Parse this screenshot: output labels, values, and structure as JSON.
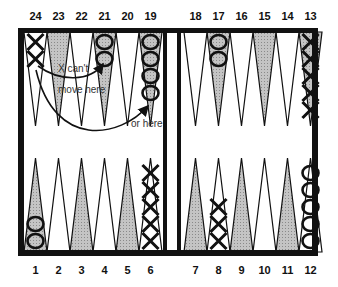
{
  "board": {
    "top_labels": [
      "24",
      "23",
      "22",
      "21",
      "20",
      "19",
      "18",
      "17",
      "16",
      "15",
      "14",
      "13"
    ],
    "bottom_labels": [
      "1",
      "2",
      "3",
      "4",
      "5",
      "6",
      "7",
      "8",
      "9",
      "10",
      "11",
      "12"
    ],
    "colors": {
      "frame": "#111111",
      "shaded_point": "#b8b8b8",
      "light_point": "#ffffff",
      "checker_ink": "#111111"
    }
  },
  "checkers": [
    {
      "point": 24,
      "symbol": "X",
      "count": 2
    },
    {
      "point": 21,
      "symbol": "O",
      "count": 2
    },
    {
      "point": 19,
      "symbol": "O",
      "count": 4
    },
    {
      "point": 17,
      "symbol": "O",
      "count": 2
    },
    {
      "point": 13,
      "symbol": "X",
      "count": 5
    },
    {
      "point": 1,
      "symbol": "O",
      "count": 2
    },
    {
      "point": 6,
      "symbol": "X",
      "count": 5
    },
    {
      "point": 8,
      "symbol": "X",
      "count": 3
    },
    {
      "point": 12,
      "symbol": "O",
      "count": 5
    }
  ],
  "annotations": {
    "cant_move_line1": "X can't",
    "cant_move_line2": "move here",
    "or_here": "or here"
  }
}
